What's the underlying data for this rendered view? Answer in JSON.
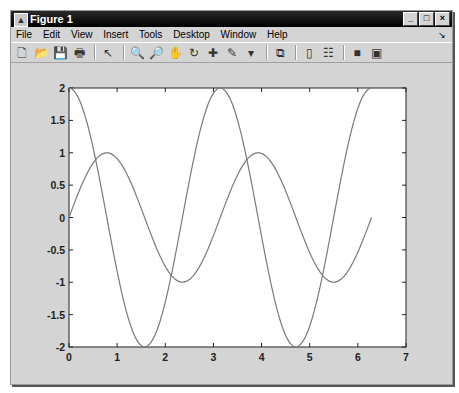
{
  "window": {
    "title": "Figure 1",
    "controls": {
      "minimize": "_",
      "maximize": "□",
      "close": "×"
    }
  },
  "menu": [
    "File",
    "Edit",
    "View",
    "Insert",
    "Tools",
    "Desktop",
    "Window",
    "Help"
  ],
  "dock_arrow": "↘",
  "toolbar": [
    {
      "name": "new-figure-icon",
      "glyph": "🗋"
    },
    {
      "name": "open-file-icon",
      "glyph": "📂"
    },
    {
      "name": "save-icon",
      "glyph": "💾"
    },
    {
      "name": "print-icon",
      "glyph": "🖶"
    },
    {
      "sep": true
    },
    {
      "name": "edit-plot-arrow-icon",
      "glyph": "↖"
    },
    {
      "sep": true
    },
    {
      "name": "zoom-in-icon",
      "glyph": "🔍"
    },
    {
      "name": "zoom-out-icon",
      "glyph": "🔎"
    },
    {
      "name": "pan-hand-icon",
      "glyph": "✋"
    },
    {
      "name": "rotate-3d-icon",
      "glyph": "↻"
    },
    {
      "name": "data-cursor-icon",
      "glyph": "✚"
    },
    {
      "name": "brush-icon",
      "glyph": "✎"
    },
    {
      "name": "brush-dropdown-icon",
      "glyph": "▾"
    },
    {
      "sep": true
    },
    {
      "name": "link-plot-icon",
      "glyph": "⧉"
    },
    {
      "sep": true
    },
    {
      "name": "insert-colorbar-icon",
      "glyph": "▯"
    },
    {
      "name": "insert-legend-icon",
      "glyph": "☷"
    },
    {
      "sep": true
    },
    {
      "name": "hide-plot-tools-icon",
      "glyph": "■"
    },
    {
      "name": "show-plot-tools-icon",
      "glyph": "▣"
    }
  ],
  "colors": {
    "line": "#7a7a7a",
    "axes": "#222222",
    "plot_bg": "#ffffff",
    "figure_bg": "#d4d4d4"
  },
  "chart_data": {
    "type": "line",
    "title": "",
    "xlabel": "",
    "ylabel": "",
    "xlim": [
      0,
      7
    ],
    "ylim": [
      -2,
      2
    ],
    "xticks": [
      "0",
      "1",
      "2",
      "3",
      "4",
      "5",
      "6",
      "7"
    ],
    "xtick_values": [
      0,
      1,
      2,
      3,
      4,
      5,
      6,
      7
    ],
    "yticks": [
      "-2",
      "-1.5",
      "-1",
      "-0.5",
      "0",
      "0.5",
      "1",
      "1.5",
      "2"
    ],
    "ytick_values": [
      -2,
      -1.5,
      -1,
      -0.5,
      0,
      0.5,
      1,
      1.5,
      2
    ],
    "grid": false,
    "legend": null,
    "series": [
      {
        "name": "sin(2x)",
        "x_range": [
          0,
          6.2832
        ],
        "samples": 101,
        "points": [
          [
            0,
            0
          ],
          [
            0.785,
            1
          ],
          [
            1.571,
            0
          ],
          [
            2.356,
            -1
          ],
          [
            3.142,
            0
          ],
          [
            3.927,
            1
          ],
          [
            4.712,
            0
          ],
          [
            5.498,
            -1
          ],
          [
            6.283,
            0
          ]
        ]
      },
      {
        "name": "2cos(2x)",
        "x_range": [
          0,
          6.2832
        ],
        "samples": 101,
        "points": [
          [
            0,
            2
          ],
          [
            0.785,
            0
          ],
          [
            1.571,
            -2
          ],
          [
            2.356,
            0
          ],
          [
            3.142,
            2
          ],
          [
            3.927,
            0
          ],
          [
            4.712,
            -2
          ],
          [
            5.498,
            0
          ],
          [
            6.283,
            2
          ]
        ]
      }
    ]
  }
}
